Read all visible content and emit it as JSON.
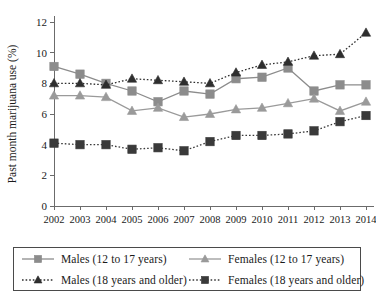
{
  "chart_data": {
    "type": "line",
    "title": "",
    "xlabel": "",
    "ylabel": "Past month marijuana use (%)",
    "categories": [
      "2002",
      "2003",
      "2004",
      "2005",
      "2006",
      "2007",
      "2008",
      "2009",
      "2010",
      "2011",
      "2012",
      "2013",
      "2014"
    ],
    "xlim": [
      2002,
      2014
    ],
    "ylim": [
      0,
      12
    ],
    "yticks": [
      0,
      2,
      4,
      6,
      8,
      10,
      12
    ],
    "ytick_labels": [
      "0",
      "2",
      "4",
      "6",
      "8",
      "10",
      "12"
    ],
    "grid": false,
    "legend_position": "below",
    "series": [
      {
        "name": "Males (12 to 17 years)",
        "marker": "square",
        "line": "solid",
        "color": "#8c8c8c",
        "marker_color": "#8c8c8c",
        "values": [
          9.1,
          8.6,
          8.0,
          7.5,
          6.8,
          7.5,
          7.3,
          8.3,
          8.4,
          9.0,
          7.5,
          7.9,
          7.9
        ]
      },
      {
        "name": "Females (12 to 17 years)",
        "marker": "triangle",
        "line": "solid",
        "color": "#9a9a9a",
        "marker_color": "#9a9a9a",
        "values": [
          7.2,
          7.2,
          7.1,
          6.2,
          6.4,
          5.8,
          6.0,
          6.3,
          6.4,
          6.7,
          7.0,
          6.2,
          6.8
        ]
      },
      {
        "name": "Males (18 years and older)",
        "marker": "triangle",
        "line": "dotted",
        "color": "#2e2e2e",
        "marker_color": "#2e2e2e",
        "values": [
          8.0,
          8.0,
          7.9,
          8.3,
          8.2,
          8.1,
          8.0,
          8.7,
          9.2,
          9.4,
          9.8,
          9.9,
          11.3
        ]
      },
      {
        "name": "Females (18 years and older)",
        "marker": "square",
        "line": "dotted",
        "color": "#3a3a3a",
        "marker_color": "#3a3a3a",
        "values": [
          4.1,
          4.0,
          4.0,
          3.7,
          3.8,
          3.6,
          4.2,
          4.6,
          4.6,
          4.7,
          4.9,
          5.5,
          5.9
        ]
      }
    ],
    "legend": [
      "Males (12 to 17 years)",
      "Females (12 to 17 years)",
      "Males (18 years and older)",
      "Females (18 years and older)"
    ]
  },
  "axes": {
    "ylabel": "Past month marijuana use (%)",
    "ytick_labels": [
      "12",
      "10",
      "8",
      "6",
      "4",
      "2",
      "0"
    ],
    "xtick_labels": [
      "2002",
      "2003",
      "2004",
      "2005",
      "2006",
      "2007",
      "2008",
      "2009",
      "2010",
      "2011",
      "2012",
      "2013",
      "2014"
    ]
  },
  "legend": {
    "items": [
      {
        "label": "Males (12 to 17 years)",
        "marker": "square",
        "line": "solid",
        "color": "#8c8c8c"
      },
      {
        "label": "Females (12 to 17 years)",
        "marker": "triangle",
        "line": "solid",
        "color": "#9a9a9a"
      },
      {
        "label": "Males (18 years and older)",
        "marker": "triangle",
        "line": "dotted",
        "color": "#2e2e2e"
      },
      {
        "label": "Females (18 years and older)",
        "marker": "square",
        "line": "dotted",
        "color": "#3a3a3a"
      }
    ]
  }
}
